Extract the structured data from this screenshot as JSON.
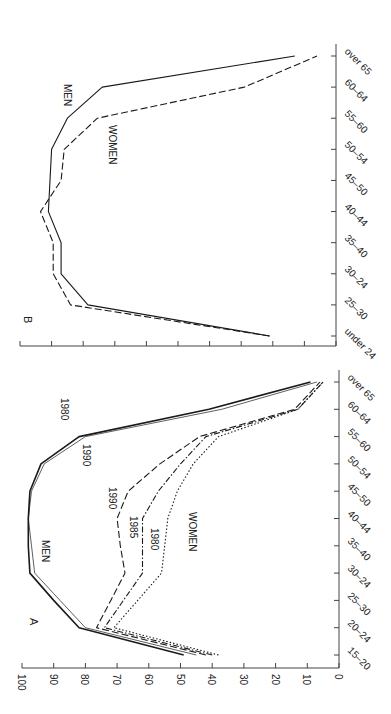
{
  "figure": {
    "orientation": "rotated 90 degrees clockwise",
    "background": "#ffffff"
  },
  "chart_data": [
    {
      "panel_label": "A",
      "type": "line",
      "title": "",
      "xlabel": "",
      "ylabel": "",
      "categories": [
        "15–20",
        "20–24",
        "25–30",
        "30–24",
        "35–40",
        "40–44",
        "45–50",
        "50–54",
        "55–60",
        "60–64",
        "over 65"
      ],
      "yticks": [
        0,
        10,
        20,
        30,
        40,
        50,
        60,
        70,
        80,
        90,
        100
      ],
      "ylim": [
        0,
        100
      ],
      "grid": false,
      "annotations": [
        "MEN",
        "WOMEN",
        "1980",
        "1990",
        "1990",
        "1985",
        "1980"
      ],
      "series": [
        {
          "name": "Men 1980",
          "group": "MEN",
          "label": "1980",
          "style": "solid-thick",
          "values": [
            49,
            82,
            90,
            97.5,
            98,
            98,
            97.5,
            94,
            82,
            41,
            9
          ]
        },
        {
          "name": "Men 1990",
          "group": "MEN",
          "label": "1990",
          "style": "solid-thin",
          "values": [
            45,
            80,
            88,
            96,
            97,
            98,
            97,
            93,
            80,
            37,
            7
          ]
        },
        {
          "name": "Women 1990",
          "group": "WOMEN",
          "label": "1990",
          "style": "long-dash",
          "values": [
            42,
            76.5,
            72,
            67.5,
            69,
            70,
            66.5,
            56.5,
            44,
            14,
            6
          ]
        },
        {
          "name": "Women 1985",
          "group": "WOMEN",
          "label": "1985",
          "style": "dash-dot",
          "values": [
            40,
            74,
            68,
            62,
            62,
            62,
            57,
            50,
            42,
            13,
            5
          ]
        },
        {
          "name": "Women 1980",
          "group": "WOMEN",
          "label": "1980",
          "style": "dotted",
          "values": [
            38,
            71,
            63.5,
            56,
            55,
            54,
            51,
            46,
            38,
            13,
            5
          ]
        }
      ]
    },
    {
      "panel_label": "B",
      "type": "line",
      "title": "",
      "xlabel": "",
      "ylabel": "",
      "categories": [
        "under 24",
        "25–30",
        "30–24",
        "35–40",
        "40–44",
        "45–50",
        "50–54",
        "55–60",
        "60–64",
        "over 65"
      ],
      "yticks": [
        0,
        10,
        20,
        30,
        40,
        50,
        60,
        70,
        80,
        90,
        100
      ],
      "ylim": [
        0,
        100
      ],
      "ytick_labels_shown": false,
      "grid": false,
      "annotations": [
        "MEN",
        "WOMEN"
      ],
      "series": [
        {
          "name": "MEN",
          "style": "solid",
          "values": [
            21,
            78.5,
            87,
            87,
            91,
            90.5,
            90,
            85,
            74,
            13
          ]
        },
        {
          "name": "WOMEN",
          "style": "dashed",
          "values": [
            21,
            84,
            89.5,
            89.5,
            93.5,
            87,
            86,
            75.5,
            29,
            6
          ]
        }
      ]
    }
  ],
  "labels": {
    "panel_a": "A",
    "panel_b": "B",
    "men": "MEN",
    "women": "WOMEN",
    "men_1980": "1980",
    "men_1990": "1990",
    "women_1990": "1990",
    "women_1985": "1985",
    "women_1980": "1980"
  }
}
